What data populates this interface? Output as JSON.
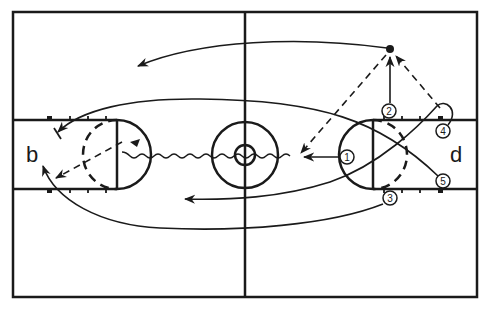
{
  "diagram": {
    "type": "basketball-play-diagram",
    "court": {
      "orientation": "horizontal",
      "line_color": "#1a1a1a",
      "background": "#ffffff"
    },
    "baskets": {
      "left_label": "b",
      "right_label": "d"
    },
    "players": [
      {
        "id": "1",
        "label": "1",
        "x": 347,
        "y": 157
      },
      {
        "id": "2",
        "label": "2",
        "x": 389,
        "y": 111
      },
      {
        "id": "3",
        "label": "3",
        "x": 390,
        "y": 198
      },
      {
        "id": "4",
        "label": "4",
        "x": 443,
        "y": 131
      },
      {
        "id": "5",
        "label": "5",
        "x": 443,
        "y": 181
      }
    ],
    "ball": {
      "label": "ball",
      "x": 390,
      "y": 50
    },
    "movements": [
      {
        "type": "dribble",
        "from": "1",
        "description": "Player 1 dribbles to the left toward the center"
      },
      {
        "type": "pass",
        "from": "2",
        "to": "ball",
        "description": "Player 2 cuts up to ball position"
      },
      {
        "type": "pass",
        "from": "4",
        "to": "ball",
        "description": "Dashed pass line from 4 toward ball"
      },
      {
        "type": "pass",
        "from": "ball",
        "to": "center",
        "description": "Dashed pass line from ball down-left"
      },
      {
        "type": "cut",
        "from": "ball",
        "description": "Long curved cut from ball to upper left"
      },
      {
        "type": "cut",
        "from": "5",
        "description": "Long curved cut from 5 to left key top"
      },
      {
        "type": "cut",
        "from": "4",
        "description": "Loop from 4 curving down across the key"
      },
      {
        "type": "cut",
        "from": "3",
        "description": "Long curved cut from 3 along the bottom to left baseline"
      },
      {
        "type": "screen",
        "description": "Screen marker near left key top"
      },
      {
        "type": "pass",
        "description": "Dashed pass inside left key"
      }
    ]
  }
}
